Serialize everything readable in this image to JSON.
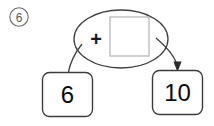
{
  "problem": {
    "number_label": "6",
    "marker_shape": "circle"
  },
  "diagram": {
    "type": "part-whole-operation-diagram",
    "operator_node": {
      "shape": "ellipse",
      "operator": "+",
      "answer_box": {
        "value": "",
        "state": "empty",
        "border_color": "#b9b9b9"
      }
    },
    "nodes": [
      {
        "id": "left-operand",
        "label": "6",
        "shape": "rounded-square",
        "connector": "plain-line"
      },
      {
        "id": "right-operand",
        "label": "10",
        "shape": "rounded-square",
        "connector": "arrow"
      }
    ]
  },
  "colors": {
    "ink": "#3f3f3f",
    "text": "#0a0a0a",
    "answer_box_border": "#b9b9b9",
    "marker": "#6e6e70",
    "background": "#ffffff"
  }
}
